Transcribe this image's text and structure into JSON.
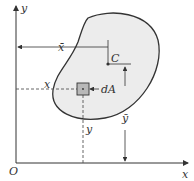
{
  "diagram": {
    "axes": {
      "x_label": "x",
      "y_label": "y",
      "origin_label": "O"
    },
    "centroid_label": "C",
    "element_label": "dA",
    "xbar_label": "x̄",
    "ybar_label": "ȳ",
    "x_coord_label": "x",
    "y_coord_label": "y",
    "colors": {
      "region_fill": "#ececec",
      "element_fill": "#b8b8b8",
      "line": "#333333"
    }
  }
}
